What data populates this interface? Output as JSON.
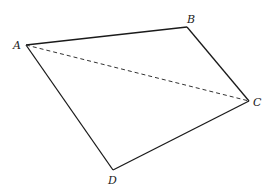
{
  "figure": {
    "type": "quadrilateral",
    "vertices": [
      {
        "id": "A",
        "label": "A"
      },
      {
        "id": "B",
        "label": "B"
      },
      {
        "id": "C",
        "label": "C"
      },
      {
        "id": "D",
        "label": "D"
      }
    ],
    "edges": [
      {
        "from": "A",
        "to": "B",
        "style": "solid"
      },
      {
        "from": "B",
        "to": "C",
        "style": "solid"
      },
      {
        "from": "C",
        "to": "D",
        "style": "solid"
      },
      {
        "from": "D",
        "to": "A",
        "style": "solid"
      },
      {
        "from": "A",
        "to": "C",
        "style": "dashed"
      }
    ],
    "colors": {
      "line": "#1a1a1a",
      "background": "#ffffff"
    }
  }
}
